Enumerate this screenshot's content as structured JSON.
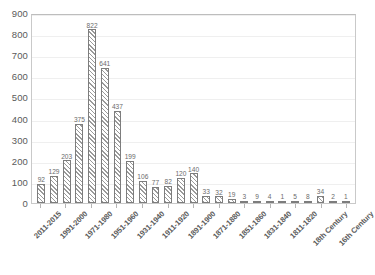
{
  "chart_data": {
    "type": "bar",
    "title": "",
    "xlabel": "",
    "ylabel": "",
    "ylim": [
      0,
      900
    ],
    "ytick_values": [
      900,
      800,
      700,
      600,
      500,
      400,
      300,
      200,
      100,
      0
    ],
    "grid": true,
    "legend": "none",
    "categories": [
      "2011-2015",
      "2001-2010",
      "1991-2000",
      "1981-1990",
      "1971-1980",
      "1961-1970",
      "1951-1960",
      "1941-1950",
      "1931-1940",
      "1921-1930",
      "1911-1920",
      "1901-1910",
      "1891-1900",
      "1881-1890",
      "1871-1880",
      "1861-1870",
      "1851-1860",
      "1841-1850",
      "1831-1840",
      "1821-1830",
      "1811-1820",
      "1801-1810",
      "18th Century",
      "17th Century",
      "16th Century"
    ],
    "tick_labels": [
      "2011-2015",
      "",
      "1991-2000",
      "",
      "1971-1980",
      "",
      "1951-1960",
      "",
      "1931-1940",
      "",
      "1911-1920",
      "",
      "1891-1900",
      "",
      "1871-1880",
      "",
      "1851-1860",
      "",
      "1831-1840",
      "",
      "1811-1820",
      "",
      "18th Century",
      "",
      "16th Century"
    ],
    "values": [
      92,
      129,
      203,
      375,
      822,
      641,
      437,
      199,
      106,
      77,
      82,
      120,
      140,
      33,
      32,
      19,
      3,
      9,
      4,
      1,
      5,
      8,
      34,
      2,
      1
    ],
    "colors": {
      "bar_fill": "#ffffff",
      "bar_hatch": "#9a9a9a",
      "bar_border": "#7d7d7d",
      "gridline": "#efefef",
      "axis_border": "#c9c9c9",
      "text": "#5a5a5a",
      "background": "#ffffff"
    }
  }
}
